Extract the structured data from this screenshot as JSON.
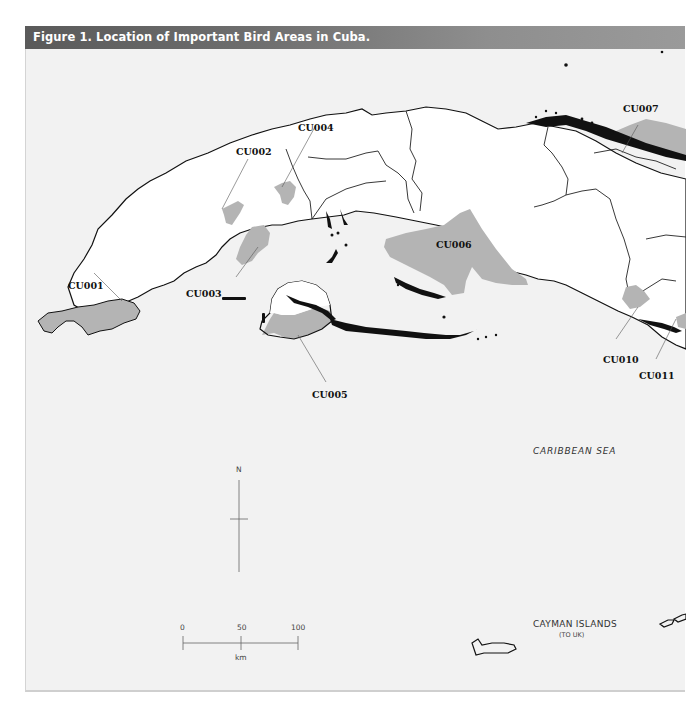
{
  "figure": {
    "title": "Figure 1. Location of Important Bird Areas in Cuba."
  },
  "colors": {
    "sea": "#f2f2f2",
    "land": "#ffffff",
    "iba": "#b4b4b4",
    "coast": "#111111",
    "title_bar_left": "#5a5a5a",
    "title_bar_right": "#9a9a9a"
  },
  "iba_labels": [
    {
      "id": "CU001",
      "text": "CU001"
    },
    {
      "id": "CU002",
      "text": "CU002"
    },
    {
      "id": "CU003",
      "text": "CU003"
    },
    {
      "id": "CU004",
      "text": "CU004"
    },
    {
      "id": "CU005",
      "text": "CU005"
    },
    {
      "id": "CU006",
      "text": "CU006"
    },
    {
      "id": "CU007",
      "text": "CU007"
    },
    {
      "id": "CU010",
      "text": "CU010"
    },
    {
      "id": "CU011",
      "text": "CU011"
    }
  ],
  "place_labels": {
    "sea": "CARIBBEAN SEA",
    "cayman": "CAYMAN ISLANDS",
    "cayman_sub": "(TO UK)"
  },
  "north_arrow": {
    "label": "N"
  },
  "scale_bar": {
    "ticks": [
      "0",
      "50",
      "100"
    ],
    "unit": "km"
  }
}
